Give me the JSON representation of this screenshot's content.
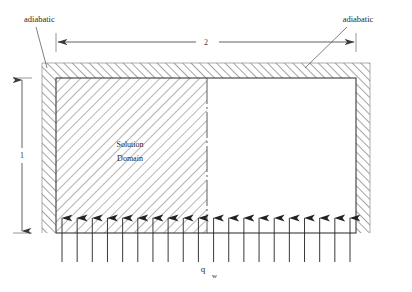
{
  "diagram": {
    "labels": {
      "adiabatic_left": "adiabatic",
      "adiabatic_right": "adiabatic",
      "width_dimension": "2",
      "height_dimension": "1",
      "domain_line1": "Solution",
      "domain_line2": "Domain",
      "heat_flux": "q",
      "heat_flux_subscript": "w"
    },
    "colors": {
      "line": "#333333",
      "hatch": "#555555",
      "arrow": "#222222",
      "background": "#ffffff",
      "dimension": "#3a3a3a"
    },
    "geometry": {
      "outer_wall": {
        "x": 42,
        "y": 63,
        "width": 328,
        "height": 170
      },
      "inner_box": {
        "x": 56,
        "y": 78,
        "width": 300,
        "height": 155
      },
      "divider_x": 207,
      "arrow_count": 20,
      "arrow_first_x": 62,
      "arrow_last_x": 350,
      "arrow_tail_y": 262,
      "arrow_head_y": 218,
      "dim_h_y": 42,
      "dim_v_x": 22
    },
    "icons": {
      "arrow_up": "arrow-up-icon",
      "leader": "leader-line-icon"
    }
  }
}
